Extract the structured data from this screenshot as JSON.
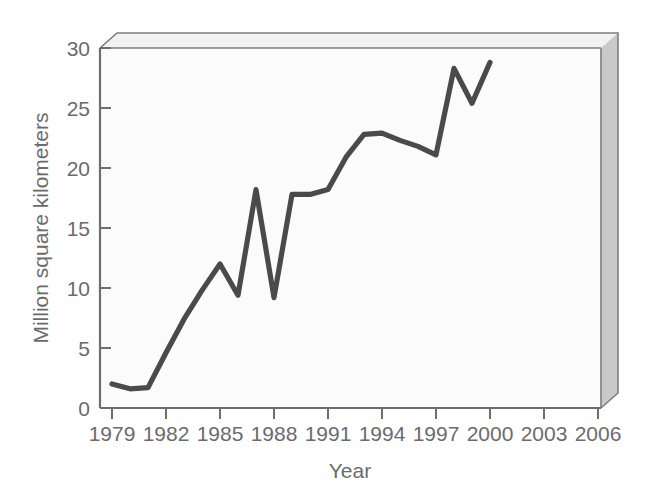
{
  "chart_data": {
    "type": "line",
    "title": "",
    "subtitle": "",
    "xlabel": "Year",
    "ylabel": "Million square kilometers",
    "xlim": [
      1979,
      2006
    ],
    "ylim": [
      0,
      30
    ],
    "xticks": [
      1979,
      1982,
      1985,
      1988,
      1991,
      1994,
      1997,
      2000,
      2003,
      2006
    ],
    "xticklabels": [
      "1979",
      "1982",
      "1985",
      "1988",
      "1991",
      "1994",
      "1997",
      "2000",
      "2003",
      "2006"
    ],
    "yticks": [
      0,
      5,
      10,
      15,
      20,
      25,
      30
    ],
    "yticklabels": [
      "0",
      "5",
      "10",
      "15",
      "20",
      "25",
      "30"
    ],
    "grid": false,
    "legend": false,
    "legend_position": "none",
    "style": "3d-walled-box",
    "x": [
      1979,
      1980,
      1981,
      1982,
      1983,
      1984,
      1985,
      1986,
      1987,
      1988,
      1989,
      1990,
      1991,
      1992,
      1993,
      1994,
      1995,
      1996,
      1997,
      1998,
      1999,
      2000
    ],
    "series": [
      {
        "name": "Ozone hole area",
        "color": "#4a4a4a",
        "values": [
          2.0,
          1.6,
          1.7,
          4.6,
          7.4,
          9.8,
          12.0,
          9.4,
          18.2,
          9.2,
          17.8,
          17.8,
          18.2,
          20.9,
          22.8,
          22.9,
          22.3,
          21.8,
          21.1,
          28.3,
          25.4,
          28.8
        ]
      }
    ]
  },
  "axes": {
    "y_title": "Million square kilometers",
    "x_title": "Year"
  },
  "tick_labels": {
    "y": [
      "30",
      "25",
      "20",
      "15",
      "10",
      "5",
      "0"
    ],
    "x": [
      "1979",
      "1982",
      "1985",
      "1988",
      "1991",
      "1994",
      "1997",
      "2000",
      "2003",
      "2006"
    ]
  },
  "colors": {
    "line": "#4a4a4a",
    "axis": "#6e6e6e",
    "frame": "#7d7d7d",
    "wall": "#fbfbfb",
    "side_face": "#c9c9c9",
    "top_face": "#f2f2f2",
    "text": "#6b6b6b",
    "background": "#ffffff"
  }
}
